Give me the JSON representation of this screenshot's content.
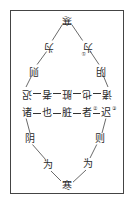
{
  "diagram": {
    "title": "",
    "top_half_rotated": {
      "apex": "寒",
      "left_upper": "为",
      "right_upper": "为",
      "right_upper_note": "①",
      "left_lower": "则",
      "right_lower": "阴",
      "row": [
        "迟",
        "者",
        "脏",
        "也",
        "诸"
      ]
    },
    "bottom_half": {
      "row": [
        "诸",
        "也",
        "脏",
        "者",
        "迟"
      ],
      "row_notes": {
        "3": "②",
        "4": "③"
      },
      "left_upper": "阴",
      "right_upper": "则",
      "left_lower": "为",
      "right_lower": "为",
      "apex": "寒"
    },
    "colors": {
      "ink": "#2a2a2a",
      "border": "#444444",
      "background": "#ffffff"
    }
  }
}
